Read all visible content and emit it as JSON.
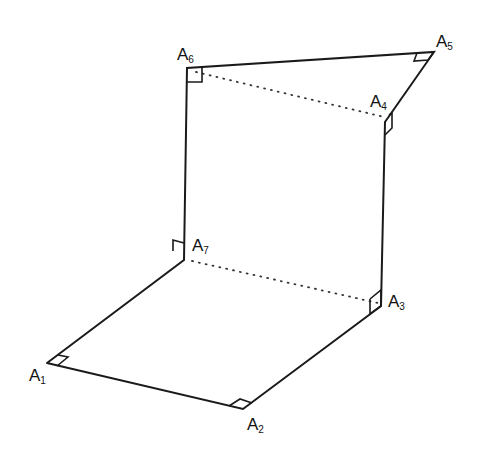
{
  "diagram": {
    "points": {
      "A1": [
        47,
        363
      ],
      "A2": [
        243,
        409
      ],
      "A3": [
        381,
        306
      ],
      "A4": [
        385,
        122
      ],
      "A5": [
        434,
        52
      ],
      "A6": [
        187,
        68
      ],
      "A7": [
        184,
        260
      ]
    },
    "solid_edges": [
      [
        "A1",
        "A2"
      ],
      [
        "A2",
        "A3"
      ],
      [
        "A3",
        "A4"
      ],
      [
        "A4",
        "A5"
      ],
      [
        "A5",
        "A6"
      ],
      [
        "A6",
        "A7"
      ],
      [
        "A7",
        "A1"
      ]
    ],
    "dotted_edges": [
      [
        "A6",
        "A4"
      ],
      [
        "A7",
        "A3"
      ]
    ],
    "labels": [
      {
        "id": "A1",
        "base": "A",
        "sub": "1"
      },
      {
        "id": "A2",
        "base": "A",
        "sub": "2"
      },
      {
        "id": "A3",
        "base": "A",
        "sub": "3"
      },
      {
        "id": "A4",
        "base": "A",
        "sub": "4"
      },
      {
        "id": "A5",
        "base": "A",
        "sub": "5"
      },
      {
        "id": "A6",
        "base": "A",
        "sub": "6"
      },
      {
        "id": "A7",
        "base": "A",
        "sub": "7"
      }
    ],
    "right_angle_marks": [
      "A1",
      "A2",
      "A3",
      "A4",
      "A5",
      "A6",
      "A7"
    ],
    "colors": {
      "line": "#1a1a1a",
      "background": "#ffffff"
    }
  }
}
